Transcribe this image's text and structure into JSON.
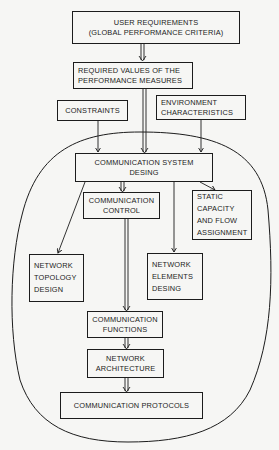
{
  "diagram": {
    "nodes": {
      "user_requirements": {
        "line1": "USER REQUIREMENTS",
        "line2": "(GLOBAL PERFORMANCE CRITERIA)"
      },
      "required_values": {
        "line1": "REQUIRED VALUES OF THE",
        "line2": "PERFORMANCE MEASURES"
      },
      "constraints": {
        "line1": "CONSTRAINTS"
      },
      "environment": {
        "line1": "ENVIRONMENT",
        "line2": "CHARACTERISTICS"
      },
      "system_design": {
        "line1": "COMMUNICATION SYSTEM",
        "line2": "DESING"
      },
      "comm_control": {
        "line1": "COMMUNICATION",
        "line2": "CONTROL"
      },
      "static_capacity": {
        "line1": "STATIC",
        "line2": "CAPACITY",
        "line3": "AND FLOW",
        "line4": "ASSIGNMENT"
      },
      "topology_design": {
        "line1": "NETWORK",
        "line2": "TOPOLOGY",
        "line3": "DESIGN"
      },
      "elements_design": {
        "line1": "NETWORK",
        "line2": "ELEMENTS",
        "line3": "DESING"
      },
      "comm_functions": {
        "line1": "COMMUNICATION",
        "line2": "FUNCTIONS"
      },
      "network_architecture": {
        "line1": "NETWORK",
        "line2": "ARCHITECTURE"
      },
      "comm_protocols": {
        "line1": "COMMUNICATION PROTOCOLS"
      }
    },
    "edges": [
      {
        "from": "user_requirements",
        "to": "required_values",
        "style": "double-arrow"
      },
      {
        "from": "required_values",
        "to": "system_design",
        "style": "double-arrow"
      },
      {
        "from": "constraints",
        "to": "system_design",
        "style": "arrow"
      },
      {
        "from": "environment",
        "to": "system_design",
        "style": "arrow"
      },
      {
        "from": "system_design",
        "to": "comm_control",
        "style": "double-arrow"
      },
      {
        "from": "system_design",
        "to": "topology_design",
        "style": "arrow"
      },
      {
        "from": "system_design",
        "to": "elements_design",
        "style": "arrow"
      },
      {
        "from": "system_design",
        "to": "static_capacity",
        "style": "arrow"
      },
      {
        "from": "comm_control",
        "to": "comm_functions",
        "style": "double-arrow"
      },
      {
        "from": "comm_functions",
        "to": "network_architecture",
        "style": "double-arrow"
      },
      {
        "from": "network_architecture",
        "to": "comm_protocols",
        "style": "double-arrow"
      }
    ],
    "colors": {
      "ink": "#1c1c1c",
      "paper": "#f6f6f4"
    }
  }
}
